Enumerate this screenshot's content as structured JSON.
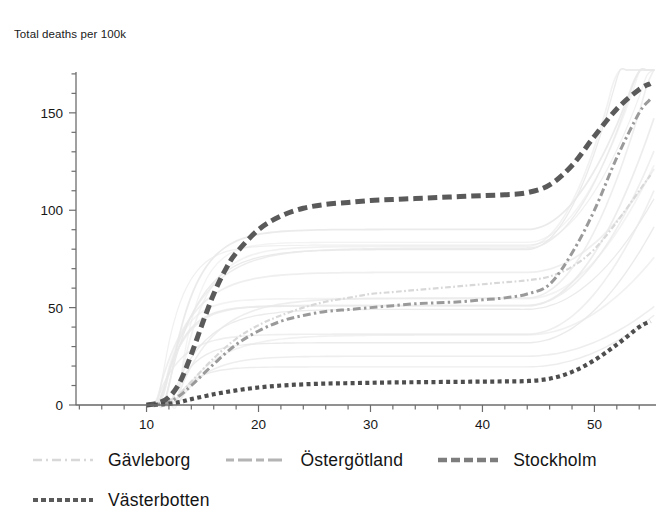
{
  "chart_data": {
    "type": "line",
    "title": "Total deaths per 100k",
    "ylabel": "Total deaths per 100k",
    "xlabel": "",
    "xlim": [
      3.7,
      55.5
    ],
    "ylim": [
      0,
      172
    ],
    "grid": false,
    "legend_position": "bottom-left",
    "x_ticks": [
      10,
      20,
      30,
      40,
      50
    ],
    "x_tick_labels": [
      "10",
      "20",
      "30",
      "40",
      "50"
    ],
    "x_minor_step": 2,
    "y_ticks": [
      0,
      50,
      100,
      150
    ],
    "y_tick_labels": [
      "0",
      "50",
      "100",
      "150"
    ],
    "y_minor_step": 10,
    "series": [
      {
        "name": "Gävleborg",
        "color": "#d8d8d8",
        "style": "dashdot",
        "width": 2.2,
        "highlighted": true,
        "x": [
          10,
          11,
          12,
          13,
          14,
          16,
          18,
          20,
          22,
          24,
          26,
          28,
          30,
          32,
          34,
          36,
          38,
          40,
          42,
          44,
          46,
          48,
          50,
          52,
          54,
          55
        ],
        "values": [
          0,
          0.5,
          2,
          6,
          12,
          24,
          34,
          41,
          46,
          50,
          53,
          55,
          57,
          58,
          59,
          60,
          61,
          62,
          63,
          64,
          66,
          71,
          80,
          94,
          110,
          118
        ]
      },
      {
        "name": "Östergötland",
        "color": "#9a9a9a",
        "style": "dashdot",
        "width": 3.0,
        "highlighted": true,
        "x": [
          10,
          11,
          12,
          13,
          14,
          16,
          18,
          20,
          22,
          24,
          26,
          28,
          30,
          32,
          34,
          36,
          38,
          40,
          42,
          44,
          46,
          48,
          50,
          52,
          54,
          55
        ],
        "values": [
          0,
          0.4,
          1.5,
          5,
          10,
          21,
          31,
          38,
          43,
          46,
          48,
          49,
          50,
          51,
          52,
          52.5,
          53,
          54,
          55,
          57,
          62,
          78,
          100,
          127,
          150,
          157
        ]
      },
      {
        "name": "Stockholm",
        "color": "#5a5a5a",
        "style": "dash",
        "width": 5.0,
        "highlighted": true,
        "x": [
          10,
          11,
          12,
          13,
          14,
          15,
          16,
          17,
          18,
          20,
          22,
          24,
          26,
          28,
          30,
          32,
          34,
          36,
          38,
          40,
          42,
          44,
          46,
          48,
          50,
          52,
          54,
          55
        ],
        "values": [
          0,
          1,
          4,
          12,
          26,
          42,
          57,
          69,
          78,
          90,
          97,
          101,
          103,
          104,
          105,
          105.5,
          106,
          106.5,
          107,
          107.5,
          108,
          109,
          113,
          123,
          138,
          152,
          162,
          165
        ]
      },
      {
        "name": "Västerbotten",
        "color": "#4e4e4e",
        "style": "dot",
        "width": 4.2,
        "highlighted": true,
        "x": [
          10,
          11,
          12,
          13,
          14,
          16,
          18,
          20,
          22,
          24,
          26,
          28,
          30,
          32,
          34,
          36,
          38,
          40,
          42,
          44,
          46,
          48,
          50,
          52,
          54,
          55
        ],
        "values": [
          0,
          0.2,
          0.6,
          1.5,
          3,
          5.5,
          7.5,
          9,
          10,
          10.6,
          11,
          11.2,
          11.4,
          11.6,
          11.7,
          11.8,
          11.9,
          12,
          12.1,
          12.3,
          13.5,
          17,
          23,
          31,
          40,
          43
        ]
      }
    ],
    "background_series_count": 17,
    "background_color": "#e9e9e9",
    "background_note": "Faint light-grey curves for all other regions, plateauing between about 20 and 90 per 100k before rising at the right edge"
  },
  "legend": {
    "rows": [
      [
        {
          "label": "Gävleborg",
          "swatch": "gavleborg-line-swatch"
        },
        {
          "label": "Östergötland",
          "swatch": "ostergotland-line-swatch"
        },
        {
          "label": "Stockholm",
          "swatch": "stockholm-line-swatch"
        }
      ],
      [
        {
          "label": "Västerbotten",
          "swatch": "vasterbotten-line-swatch"
        }
      ]
    ]
  }
}
